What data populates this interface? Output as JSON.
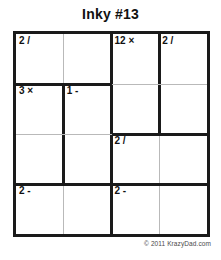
{
  "page": {
    "title": "Inky #13",
    "copyright": "© 2011 KrazyDad.com",
    "background_color": "#ffffff",
    "ink_color": "#1a1a1a",
    "thin_line_color": "#b9b9b9"
  },
  "puzzle": {
    "type": "KenKen / Inky",
    "size": 4,
    "rows": 4,
    "cols": 4,
    "cells": [
      {
        "row": 0,
        "col": 0,
        "clue": "2 /",
        "value": ""
      },
      {
        "row": 0,
        "col": 1,
        "clue": "",
        "value": ""
      },
      {
        "row": 0,
        "col": 2,
        "clue": "12 ×",
        "value": ""
      },
      {
        "row": 0,
        "col": 3,
        "clue": "2 /",
        "value": ""
      },
      {
        "row": 1,
        "col": 0,
        "clue": "3 ×",
        "value": ""
      },
      {
        "row": 1,
        "col": 1,
        "clue": "1 -",
        "value": ""
      },
      {
        "row": 1,
        "col": 2,
        "clue": "",
        "value": ""
      },
      {
        "row": 1,
        "col": 3,
        "clue": "",
        "value": ""
      },
      {
        "row": 2,
        "col": 0,
        "clue": "",
        "value": ""
      },
      {
        "row": 2,
        "col": 1,
        "clue": "",
        "value": ""
      },
      {
        "row": 2,
        "col": 2,
        "clue": "2 /",
        "value": ""
      },
      {
        "row": 2,
        "col": 3,
        "clue": "",
        "value": ""
      },
      {
        "row": 3,
        "col": 0,
        "clue": "2 -",
        "value": ""
      },
      {
        "row": 3,
        "col": 1,
        "clue": "",
        "value": ""
      },
      {
        "row": 3,
        "col": 2,
        "clue": "2 -",
        "value": ""
      },
      {
        "row": 3,
        "col": 3,
        "clue": "",
        "value": ""
      }
    ],
    "cages": [
      {
        "clue": "2 /",
        "operator": "/",
        "target": 2,
        "cells": [
          [
            0,
            0
          ],
          [
            0,
            1
          ]
        ]
      },
      {
        "clue": "12 ×",
        "operator": "×",
        "target": 12,
        "cells": [
          [
            0,
            2
          ],
          [
            1,
            2
          ]
        ]
      },
      {
        "clue": "2 /",
        "operator": "/",
        "target": 2,
        "cells": [
          [
            0,
            3
          ],
          [
            1,
            3
          ]
        ]
      },
      {
        "clue": "3 ×",
        "operator": "×",
        "target": 3,
        "cells": [
          [
            1,
            0
          ],
          [
            2,
            0
          ]
        ]
      },
      {
        "clue": "1 -",
        "operator": "-",
        "target": 1,
        "cells": [
          [
            1,
            1
          ],
          [
            2,
            1
          ]
        ]
      },
      {
        "clue": "2 /",
        "operator": "/",
        "target": 2,
        "cells": [
          [
            2,
            2
          ],
          [
            2,
            3
          ]
        ]
      },
      {
        "clue": "2 -",
        "operator": "-",
        "target": 2,
        "cells": [
          [
            3,
            0
          ],
          [
            3,
            1
          ]
        ]
      },
      {
        "clue": "2 -",
        "operator": "-",
        "target": 2,
        "cells": [
          [
            3,
            2
          ],
          [
            3,
            3
          ]
        ]
      }
    ],
    "vertical_lines": [
      {
        "col_boundary": 1,
        "row": 0,
        "weight": "thin"
      },
      {
        "col_boundary": 1,
        "row": 1,
        "weight": "thick"
      },
      {
        "col_boundary": 1,
        "row": 2,
        "weight": "thick"
      },
      {
        "col_boundary": 1,
        "row": 3,
        "weight": "thin"
      },
      {
        "col_boundary": 2,
        "row": 0,
        "weight": "thick"
      },
      {
        "col_boundary": 2,
        "row": 1,
        "weight": "thick"
      },
      {
        "col_boundary": 2,
        "row": 2,
        "weight": "thick"
      },
      {
        "col_boundary": 2,
        "row": 3,
        "weight": "thick"
      },
      {
        "col_boundary": 3,
        "row": 0,
        "weight": "thick"
      },
      {
        "col_boundary": 3,
        "row": 1,
        "weight": "thick"
      },
      {
        "col_boundary": 3,
        "row": 2,
        "weight": "thin"
      },
      {
        "col_boundary": 3,
        "row": 3,
        "weight": "thin"
      }
    ],
    "horizontal_lines": [
      {
        "row_boundary": 1,
        "col": 0,
        "weight": "thick"
      },
      {
        "row_boundary": 1,
        "col": 1,
        "weight": "thick"
      },
      {
        "row_boundary": 1,
        "col": 2,
        "weight": "thin"
      },
      {
        "row_boundary": 1,
        "col": 3,
        "weight": "thin"
      },
      {
        "row_boundary": 2,
        "col": 0,
        "weight": "thin"
      },
      {
        "row_boundary": 2,
        "col": 1,
        "weight": "thin"
      },
      {
        "row_boundary": 2,
        "col": 2,
        "weight": "thick"
      },
      {
        "row_boundary": 2,
        "col": 3,
        "weight": "thick"
      },
      {
        "row_boundary": 3,
        "col": 0,
        "weight": "thick"
      },
      {
        "row_boundary": 3,
        "col": 1,
        "weight": "thick"
      },
      {
        "row_boundary": 3,
        "col": 2,
        "weight": "thick"
      },
      {
        "row_boundary": 3,
        "col": 3,
        "weight": "thick"
      }
    ]
  }
}
